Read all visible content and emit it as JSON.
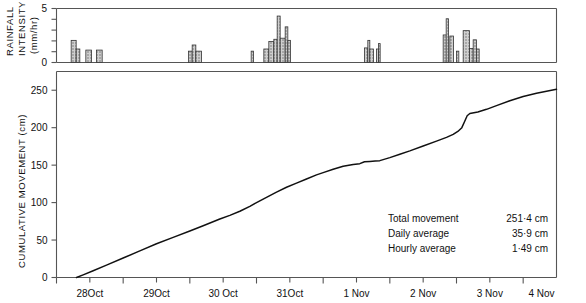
{
  "figure": {
    "background": "#ffffff",
    "line_color": "#111111",
    "bar_fill": "#b9b9b9",
    "bar_edge": "#333333",
    "axis_color": "#555555"
  },
  "annotations": {
    "line1_label": "Total movement",
    "line1_value": "251·4 cm",
    "line2_label": "Daily average",
    "line2_value": "35·9 cm",
    "line3_label": "Hourly average",
    "line3_value": "1·49 cm"
  },
  "chart_data": [
    {
      "type": "bar",
      "title": "",
      "ylabel": "RAINFALL INTENSITY (mm/hr)",
      "ylabel_lines": [
        "RAINFALL",
        "INTENSITY",
        "(mm/hr)"
      ],
      "xlabel": "",
      "ylim": [
        0,
        5
      ],
      "xlim": [
        0,
        7.5
      ],
      "yticks": [
        0,
        5
      ],
      "ytick_labels": [
        "0",
        "5"
      ],
      "yminor_ticks": [
        1,
        2,
        3,
        4
      ],
      "grid": false,
      "legend": "none",
      "note": "x is days since 28 Oct 00:00; bars are hourly rainfall intensity blocks (x_start, width_days, height_mm_per_hr)",
      "bars": [
        {
          "x": 0.22,
          "w": 0.075,
          "h": 2.05
        },
        {
          "x": 0.295,
          "w": 0.055,
          "h": 1.25
        },
        {
          "x": 0.44,
          "w": 0.085,
          "h": 1.15
        },
        {
          "x": 0.6,
          "w": 0.085,
          "h": 1.15
        },
        {
          "x": 1.98,
          "w": 0.055,
          "h": 1.05
        },
        {
          "x": 2.035,
          "w": 0.055,
          "h": 1.62
        },
        {
          "x": 2.09,
          "w": 0.085,
          "h": 1.05
        },
        {
          "x": 2.92,
          "w": 0.035,
          "h": 1.05
        },
        {
          "x": 3.11,
          "w": 0.075,
          "h": 1.25
        },
        {
          "x": 3.185,
          "w": 0.075,
          "h": 1.95
        },
        {
          "x": 3.26,
          "w": 0.05,
          "h": 2.15
        },
        {
          "x": 3.31,
          "w": 0.045,
          "h": 4.3
        },
        {
          "x": 3.355,
          "w": 0.075,
          "h": 2.25
        },
        {
          "x": 3.43,
          "w": 0.04,
          "h": 3.3
        },
        {
          "x": 3.47,
          "w": 0.04,
          "h": 2.05
        },
        {
          "x": 4.62,
          "w": 0.05,
          "h": 1.35
        },
        {
          "x": 4.67,
          "w": 0.03,
          "h": 2.05
        },
        {
          "x": 4.7,
          "w": 0.055,
          "h": 1.25
        },
        {
          "x": 4.8,
          "w": 0.03,
          "h": 1.25
        },
        {
          "x": 4.83,
          "w": 0.025,
          "h": 1.75
        },
        {
          "x": 5.8,
          "w": 0.06,
          "h": 2.55
        },
        {
          "x": 5.845,
          "w": 0.035,
          "h": 4.05
        },
        {
          "x": 5.9,
          "w": 0.055,
          "h": 2.45
        },
        {
          "x": 6.0,
          "w": 0.035,
          "h": 1.05
        },
        {
          "x": 6.1,
          "w": 0.095,
          "h": 2.95
        },
        {
          "x": 6.195,
          "w": 0.055,
          "h": 1.3
        },
        {
          "x": 6.25,
          "w": 0.05,
          "h": 2.1
        },
        {
          "x": 6.3,
          "w": 0.04,
          "h": 1.25
        }
      ]
    },
    {
      "type": "line",
      "title": "",
      "ylabel": "CUMULATIVE MOVEMENT (cm)",
      "xlabel": "",
      "ylim": [
        0,
        275
      ],
      "xlim": [
        0,
        7.5
      ],
      "yticks": [
        0,
        50,
        100,
        150,
        200,
        250
      ],
      "ytick_labels": [
        "0",
        "50",
        "100",
        "150",
        "200",
        "250"
      ],
      "xticks": [
        0.5,
        1.5,
        2.5,
        3.5,
        4.5,
        5.5,
        6.5
      ],
      "xtick_labels": [
        "28Oct",
        "29Oct",
        "30 Oct",
        "31Oct",
        "1 Nov",
        "2 Nov",
        "3 Nov"
      ],
      "xtick_extra_label": "4 Nov",
      "xtick_extra_at": 7.5,
      "xminor_ticks": [
        0,
        1,
        2,
        3,
        4,
        5,
        6,
        7
      ],
      "grid": false,
      "legend": "none",
      "units_x": "days (28 Oct 00:00 = 0)",
      "units_y": "cm",
      "series": [
        {
          "name": "Cumulative movement",
          "x": [
            0.3,
            0.4,
            0.55,
            0.75,
            1.0,
            1.25,
            1.5,
            1.75,
            2.0,
            2.2,
            2.45,
            2.6,
            2.75,
            2.9,
            3.0,
            3.15,
            3.3,
            3.45,
            3.6,
            3.75,
            3.9,
            4.0,
            4.15,
            4.3,
            4.45,
            4.55,
            4.62,
            4.7,
            4.78,
            4.85,
            5.0,
            5.15,
            5.3,
            5.5,
            5.7,
            5.85,
            5.95,
            6.02,
            6.08,
            6.12,
            6.16,
            6.2,
            6.26,
            6.32,
            6.45,
            6.6,
            6.8,
            7.0,
            7.2,
            7.5
          ],
          "y": [
            0.0,
            3.5,
            9.0,
            16.5,
            26.0,
            35.5,
            45.0,
            53.5,
            62.0,
            69.0,
            78.0,
            83.0,
            88.5,
            95.0,
            100.0,
            107.0,
            114.0,
            120.5,
            126.0,
            131.5,
            137.0,
            140.0,
            144.5,
            148.5,
            151.0,
            152.0,
            154.5,
            155.0,
            155.5,
            156.0,
            160.0,
            164.5,
            169.0,
            175.5,
            182.0,
            187.0,
            191.0,
            195.0,
            200.0,
            208.0,
            216.0,
            219.0,
            220.0,
            221.0,
            224.5,
            229.5,
            236.0,
            241.5,
            246.0,
            251.4
          ]
        }
      ]
    }
  ]
}
